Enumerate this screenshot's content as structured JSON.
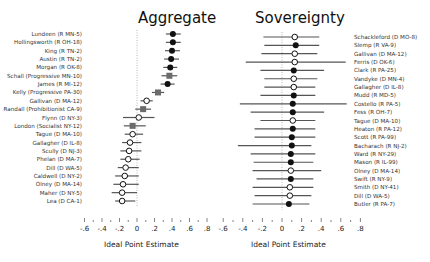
{
  "chart_data": [
    {
      "type": "dot-whisker",
      "title": "Aggregate",
      "xlabel": "Ideal Point Estimate",
      "xlim": [
        -0.6,
        0.8
      ],
      "xticks": [
        "-.6",
        "-.4",
        "-.2",
        "0",
        ".2",
        ".4",
        ".6",
        ".8"
      ],
      "reference_line": 0,
      "label_side": "left",
      "marker_legend": {
        "filled-circle": "Republican",
        "open-circle": "Democrat",
        "gray-square": "Third party"
      },
      "rows": [
        {
          "label": "Lundeen (R MN-5)",
          "estimate": 0.41,
          "low": 0.33,
          "high": 0.5,
          "marker": "filled"
        },
        {
          "label": "Hollingsworth (R OH-18)",
          "estimate": 0.41,
          "low": 0.33,
          "high": 0.5,
          "marker": "filled"
        },
        {
          "label": "King (R TN-2)",
          "estimate": 0.4,
          "low": 0.32,
          "high": 0.49,
          "marker": "filled"
        },
        {
          "label": "Austin (R TN-2)",
          "estimate": 0.39,
          "low": 0.31,
          "high": 0.48,
          "marker": "filled"
        },
        {
          "label": "Morgan (R OK-8)",
          "estimate": 0.38,
          "low": 0.3,
          "high": 0.46,
          "marker": "filled"
        },
        {
          "label": "Schall (Progressive MN-10)",
          "estimate": 0.37,
          "low": 0.28,
          "high": 0.46,
          "marker": "square"
        },
        {
          "label": "James (R MI-12)",
          "estimate": 0.35,
          "low": 0.27,
          "high": 0.43,
          "marker": "filled"
        },
        {
          "label": "Kelly (Progressive PA-30)",
          "estimate": 0.24,
          "low": 0.17,
          "high": 0.31,
          "marker": "square"
        },
        {
          "label": "Gallivan (D MA-12)",
          "estimate": 0.11,
          "low": 0.04,
          "high": 0.18,
          "marker": "open"
        },
        {
          "label": "Randall (Prohibitionist CA-9)",
          "estimate": 0.07,
          "low": -0.02,
          "high": 0.16,
          "marker": "square"
        },
        {
          "label": "Flynn (D NY-3)",
          "estimate": 0.02,
          "low": -0.16,
          "high": 0.2,
          "marker": "open"
        },
        {
          "label": "London (Socialist NY-12)",
          "estimate": -0.05,
          "low": -0.15,
          "high": 0.1,
          "marker": "square"
        },
        {
          "label": "Tague (D MA-10)",
          "estimate": -0.05,
          "low": -0.14,
          "high": 0.07,
          "marker": "open"
        },
        {
          "label": "Gallagher (D IL-8)",
          "estimate": -0.08,
          "low": -0.17,
          "high": 0.05,
          "marker": "open"
        },
        {
          "label": "Scully (D NJ-3)",
          "estimate": -0.09,
          "low": -0.19,
          "high": 0.05,
          "marker": "open"
        },
        {
          "label": "Phelan (D MA-7)",
          "estimate": -0.1,
          "low": -0.19,
          "high": 0.03,
          "marker": "open"
        },
        {
          "label": "Dill (D WA-5)",
          "estimate": -0.13,
          "low": -0.22,
          "high": 0.02,
          "marker": "open"
        },
        {
          "label": "Caldwell (D NY-2)",
          "estimate": -0.14,
          "low": -0.25,
          "high": 0.02,
          "marker": "open"
        },
        {
          "label": "Olney (D MA-14)",
          "estimate": -0.16,
          "low": -0.27,
          "high": 0.02,
          "marker": "open"
        },
        {
          "label": "Maher (D NY-5)",
          "estimate": -0.17,
          "low": -0.29,
          "high": 0.0,
          "marker": "open"
        },
        {
          "label": "Lea (D CA-1)",
          "estimate": -0.17,
          "low": -0.25,
          "high": -0.02,
          "marker": "open"
        }
      ]
    },
    {
      "type": "dot-whisker",
      "title": "Sovereignty",
      "xlabel": "Ideal Point Estimate",
      "xlim": [
        -0.6,
        0.8
      ],
      "xticks": [
        "-.6",
        "-.4",
        "-.2",
        "0",
        ".2",
        ".4",
        ".6",
        ".8"
      ],
      "reference_line": 0,
      "label_side": "right",
      "rows": [
        {
          "label": "Schackleford (D MO-8)",
          "estimate": 0.13,
          "low": -0.19,
          "high": 0.38,
          "marker": "open"
        },
        {
          "label": "Slemp (R VA-9)",
          "estimate": 0.14,
          "low": -0.18,
          "high": 0.38,
          "marker": "filled"
        },
        {
          "label": "Gallivan (D MA-12)",
          "estimate": 0.13,
          "low": -0.21,
          "high": 0.36,
          "marker": "open"
        },
        {
          "label": "Ferris (D OK-6)",
          "estimate": 0.13,
          "low": -0.37,
          "high": 0.65,
          "marker": "open"
        },
        {
          "label": "Clark (R PA-25)",
          "estimate": 0.12,
          "low": -0.22,
          "high": 0.43,
          "marker": "filled"
        },
        {
          "label": "Vandyke (D MN-4)",
          "estimate": 0.12,
          "low": -0.18,
          "high": 0.36,
          "marker": "open"
        },
        {
          "label": "Gallagher (D IL-8)",
          "estimate": 0.12,
          "low": -0.18,
          "high": 0.34,
          "marker": "open"
        },
        {
          "label": "Mudd (R MD-5)",
          "estimate": 0.12,
          "low": -0.22,
          "high": 0.34,
          "marker": "filled"
        },
        {
          "label": "Costello (R PA-5)",
          "estimate": 0.11,
          "low": -0.43,
          "high": 0.66,
          "marker": "filled"
        },
        {
          "label": "Fess (R OH-7)",
          "estimate": 0.11,
          "low": -0.32,
          "high": 0.43,
          "marker": "filled"
        },
        {
          "label": "Tague (D MA-10)",
          "estimate": 0.11,
          "low": -0.22,
          "high": 0.34,
          "marker": "open"
        },
        {
          "label": "Heaton (R PA-12)",
          "estimate": 0.11,
          "low": -0.28,
          "high": 0.34,
          "marker": "filled"
        },
        {
          "label": "Scott (R PA-99)",
          "estimate": 0.1,
          "low": -0.28,
          "high": 0.34,
          "marker": "filled"
        },
        {
          "label": "Bacharach (R NJ-2)",
          "estimate": 0.1,
          "low": -0.45,
          "high": 0.3,
          "marker": "filled"
        },
        {
          "label": "Ward (R NY-29)",
          "estimate": 0.09,
          "low": -0.32,
          "high": 0.34,
          "marker": "filled"
        },
        {
          "label": "Mason (R IL-99)",
          "estimate": 0.09,
          "low": -0.29,
          "high": 0.32,
          "marker": "filled"
        },
        {
          "label": "Olney (D MA-14)",
          "estimate": 0.09,
          "low": -0.3,
          "high": 0.4,
          "marker": "open"
        },
        {
          "label": "Swift (R NY-9)",
          "estimate": 0.09,
          "low": -0.26,
          "high": 0.32,
          "marker": "filled"
        },
        {
          "label": "Smith (D NY-41)",
          "estimate": 0.08,
          "low": -0.3,
          "high": 0.32,
          "marker": "open"
        },
        {
          "label": "Dill (D WA-5)",
          "estimate": 0.08,
          "low": -0.28,
          "high": 0.3,
          "marker": "open"
        },
        {
          "label": "Butler (R PA-7)",
          "estimate": 0.07,
          "low": -0.3,
          "high": 0.28,
          "marker": "filled"
        }
      ]
    }
  ],
  "colors": {
    "filled": "#111111",
    "open_fill": "#ffffff",
    "square": "#6b6b6b",
    "whisker": "#555555",
    "refline": "#999999"
  }
}
